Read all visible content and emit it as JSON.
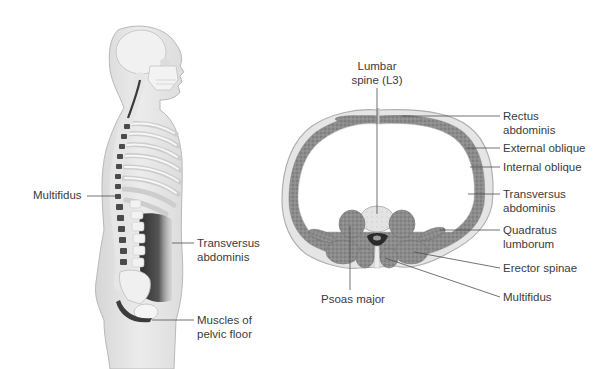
{
  "figure": {
    "left_panel": {
      "title": "Lateral view of spine and trunk",
      "labels": {
        "multifidus": "Multifidus",
        "transversus_line1": "Transversus",
        "transversus_line2": "abdominis",
        "pelvic_line1": "Muscles of",
        "pelvic_line2": "pelvic floor"
      }
    },
    "right_panel": {
      "title": "Cross-section of trunk at L3",
      "labels": {
        "lumbar_line1": "Lumbar",
        "lumbar_line2": "spine (L3)",
        "rectus_line1": "Rectus",
        "rectus_line2": "abdominis",
        "external_oblique": "External oblique",
        "internal_oblique": "Internal oblique",
        "transversus_line1": "Transversus",
        "transversus_line2": "abdominis",
        "quadratus_line1": "Quadratus",
        "quadratus_line2": "lumborum",
        "erector_spinae": "Erector spinae",
        "multifidus": "Multifidus",
        "psoas_major": "Psoas major"
      }
    },
    "colors": {
      "skin": "#e9e9e9",
      "skin_outline": "#b9b9b9",
      "bone": "#f4f4f4",
      "muscle": "#8f8f8f",
      "muscle_dark": "#555555",
      "spinal_canal": "#2b2b2b",
      "leader_line": "#555555",
      "text": "#3b3b3b"
    }
  }
}
